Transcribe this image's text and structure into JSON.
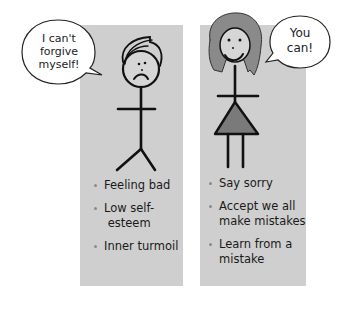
{
  "left_figure": {
    "speech_bubble": [
      "I can't",
      "forgive",
      "myself!"
    ],
    "bullets": [
      "Feeling bad",
      "Low self- esteem",
      "Inner turmoil"
    ]
  },
  "right_figure": {
    "speech_bubble": [
      "You",
      "can!"
    ],
    "bullets": [
      "Say sorry",
      "Accept we all make mistakes",
      "Learn from a mistake"
    ]
  },
  "colors": {
    "panel": "#cfcfcf",
    "background": "#ffffff",
    "hair": "#8a8a8a",
    "dress": "#7a7a7a",
    "bullet": "#8a8a8a"
  }
}
